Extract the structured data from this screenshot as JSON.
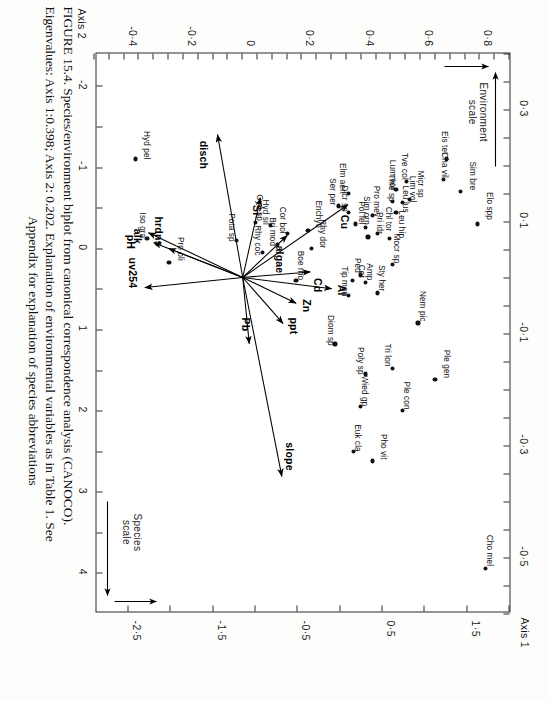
{
  "figure": {
    "caption_line1": "FIGURE 15.4.   Species/environment biplot from canonical  correspondence  analysis  (CANOCO).",
    "caption_line2": "Eigenvalues: Axis 1:0.398; Axis 2: 0.202. Explanation of environmental variables as in Table 1. See",
    "caption_line3": "Appendix for explanation of species abbreviations"
  },
  "axes": {
    "x_title": "Axis 1",
    "y_title": "Axis 2",
    "env_scale_label_line1": "Environment",
    "env_scale_label_line2": "scale",
    "species_scale_label_line1": "Species",
    "species_scale_label_line2": "scale",
    "x_species_ticks": [
      "-2",
      "-1",
      "0",
      "1",
      "2",
      "3",
      "4"
    ],
    "x_env_ticks": [
      "0·3",
      "0·1",
      "-0·1",
      "-0·3",
      "-0·5"
    ],
    "y_env_ticks": [
      "0·8",
      "0·6",
      "0·4",
      "0·2",
      "0",
      "-0·2",
      "-0·4"
    ],
    "y_species_ticks": [
      "1·5",
      "0·5",
      "-0·5",
      "-1·5",
      "-2·5"
    ]
  },
  "chart_data": {
    "type": "scatter",
    "title": "Species/environment biplot from canonical correspondence analysis (CANOCO)",
    "xlabel": "Axis 1",
    "ylabel": "Axis 2",
    "grid": false,
    "legend": "none",
    "xlim_env": [
      0.4,
      -0.6
    ],
    "ylim_env": [
      0.9,
      -0.5
    ],
    "xlim_species": [
      -2.4,
      4.5
    ],
    "ylim_species": [
      2.0,
      -2.9
    ],
    "eigenvalue_axis1": 0.398,
    "eigenvalue_axis2": 0.202,
    "species": [
      {
        "label": "Cho mel",
        "x": 3.95,
        "y": 1.72
      },
      {
        "label": "Elo spp",
        "x": -0.3,
        "y": 1.62
      },
      {
        "label": "Sim bre",
        "x": -0.7,
        "y": 1.42
      },
      {
        "label": "Eis tet",
        "x": -1.1,
        "y": 1.26
      },
      {
        "label": "Cha vil",
        "x": -0.85,
        "y": 1.22
      },
      {
        "label": "Ple gen",
        "x": 1.62,
        "y": 1.12
      },
      {
        "label": "Nem pic",
        "x": 0.92,
        "y": 0.92
      },
      {
        "label": "Tve col",
        "x": -0.82,
        "y": 0.78
      },
      {
        "label": "Micr sp",
        "x": -0.6,
        "y": 0.82
      },
      {
        "label": "Lum vor",
        "x": -0.72,
        "y": 0.66
      },
      {
        "label": "Lim vol",
        "x": -0.56,
        "y": 0.74
      },
      {
        "label": "Thie sp",
        "x": -0.58,
        "y": 0.62
      },
      {
        "label": "Leu lus",
        "x": -0.44,
        "y": 0.66
      },
      {
        "label": "Leu hip",
        "x": -0.12,
        "y": 0.58
      },
      {
        "label": "Mocr sp",
        "x": 0.2,
        "y": 0.62
      },
      {
        "label": "Chl tor",
        "x": -0.18,
        "y": 0.44
      },
      {
        "label": "Pro mey",
        "x": -0.4,
        "y": 0.38
      },
      {
        "label": "Pol fel",
        "x": -0.26,
        "y": 0.3
      },
      {
        "label": "Pri idr",
        "x": -0.14,
        "y": 0.33
      },
      {
        "label": "Sim orn",
        "x": -0.3,
        "y": 0.18
      },
      {
        "label": "Dicr sp",
        "x": -0.44,
        "y": 0.1
      },
      {
        "label": "Elm aen",
        "x": -0.68,
        "y": 0.1
      },
      {
        "label": "Ser per",
        "x": -0.52,
        "y": -0.02
      },
      {
        "label": "Sty her",
        "x": 0.55,
        "y": 0.44
      },
      {
        "label": "Amp",
        "x": 0.42,
        "y": 0.3
      },
      {
        "label": "Ped",
        "x": 0.33,
        "y": 0.24
      },
      {
        "label": "Cer",
        "x": 0.4,
        "y": 0.15
      },
      {
        "label": "Tip mon",
        "x": 0.58,
        "y": 0.1
      },
      {
        "label": "Tri lon",
        "x": 1.48,
        "y": 0.62
      },
      {
        "label": "Ple con",
        "x": 2.0,
        "y": 0.74
      },
      {
        "label": "Poly sp",
        "x": 1.55,
        "y": 0.3
      },
      {
        "label": "Wied gp",
        "x": 1.95,
        "y": 0.24
      },
      {
        "label": "Pho vit",
        "x": 2.62,
        "y": 0.38
      },
      {
        "label": "Euk cla",
        "x": 2.5,
        "y": 0.16
      },
      {
        "label": "Diom sp",
        "x": 1.18,
        "y": -0.06
      },
      {
        "label": "Rhy dor",
        "x": 0.0,
        "y": -0.34
      },
      {
        "label": "Boe rho",
        "x": 0.4,
        "y": -0.52
      },
      {
        "label": "Enchytl",
        "x": -0.22,
        "y": -0.38
      },
      {
        "label": "Cor bol",
        "x": -0.18,
        "y": -0.62
      },
      {
        "label": "Bri mod",
        "x": -0.05,
        "y": -0.74
      },
      {
        "label": "Hyd sil",
        "x": -0.28,
        "y": -0.82
      },
      {
        "label": "Rhy coc",
        "x": 0.05,
        "y": -0.92
      },
      {
        "label": "Gyri sp",
        "x": -0.32,
        "y": -1.0
      },
      {
        "label": "Pota sp",
        "x": -0.1,
        "y": -1.22
      },
      {
        "label": "Pro oli",
        "x": 0.18,
        "y": -2.02
      },
      {
        "label": "Iso gra",
        "x": -0.12,
        "y": -2.28
      },
      {
        "label": "Hyd pel",
        "x": -1.1,
        "y": -2.42
      }
    ],
    "environment_vectors": [
      {
        "label": "slope",
        "x": -0.355,
        "y": 0.132
      },
      {
        "label": "ppt",
        "x": -0.082,
        "y": 0.136
      },
      {
        "label": "Zn",
        "x": -0.046,
        "y": 0.18
      },
      {
        "label": "Al",
        "x": -0.02,
        "y": 0.3
      },
      {
        "label": "Cd",
        "x": 0.01,
        "y": 0.228
      },
      {
        "label": "Cu",
        "x": 0.13,
        "y": 0.355
      },
      {
        "label": "algae",
        "x": 0.075,
        "y": 0.15
      },
      {
        "label": "Pb",
        "x": -0.118,
        "y": 0.022
      },
      {
        "label": "Si",
        "x": 0.142,
        "y": 0.06
      },
      {
        "label": "disch",
        "x": 0.255,
        "y": -0.085
      },
      {
        "label": "uv254",
        "x": -0.018,
        "y": -0.33
      },
      {
        "label": "hrdns",
        "x": 0.052,
        "y": -0.25
      },
      {
        "label": "alk",
        "x": 0.062,
        "y": -0.3
      },
      {
        "label": "pH",
        "x": 0.08,
        "y": -0.318
      }
    ]
  }
}
